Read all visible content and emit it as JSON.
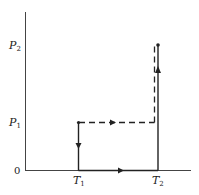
{
  "diagram": {
    "type": "pressure-temperature path diagram",
    "colors": {
      "line": "#222222",
      "background": "#ffffff"
    },
    "axes": {
      "origin_label": "0",
      "y_ticks": [
        {
          "base": "P",
          "sub": "2"
        },
        {
          "base": "P",
          "sub": "1"
        }
      ],
      "x_ticks": [
        {
          "base": "T",
          "sub": "1"
        },
        {
          "base": "T",
          "sub": "2"
        }
      ]
    },
    "paths": [
      {
        "name": "solid-path",
        "style": "solid",
        "points": [
          "(T1,P1)",
          "(T1,0)",
          "(T2,0)",
          "(T2,P2)"
        ]
      },
      {
        "name": "dashed-path",
        "style": "dashed",
        "points": [
          "(T1,P1)",
          "(T2,P1)",
          "(T2,P2)"
        ]
      }
    ]
  }
}
